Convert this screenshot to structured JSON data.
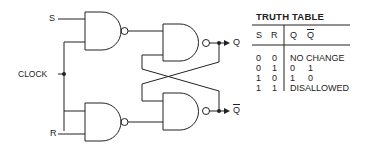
{
  "diagram": {
    "inputs": {
      "s_label": "S",
      "r_label": "R",
      "clock_label": "CLOCK"
    },
    "outputs": {
      "q_label": "Q",
      "qbar_label": "Q"
    },
    "gates": [
      {
        "id": "nand-s",
        "type": "NAND",
        "inputs": [
          "S",
          "CLOCK"
        ]
      },
      {
        "id": "nand-r",
        "type": "NAND",
        "inputs": [
          "CLOCK",
          "R"
        ]
      },
      {
        "id": "nand-q",
        "type": "NAND",
        "inputs": [
          "nand-s",
          "Q-bar feedback"
        ]
      },
      {
        "id": "nand-qbar",
        "type": "NAND",
        "inputs": [
          "Q feedback",
          "nand-r"
        ]
      }
    ],
    "colors": {
      "line": "#222222",
      "background": "#ffffff"
    }
  },
  "truth_table": {
    "title": "TRUTH TABLE",
    "headers": {
      "s": "S",
      "r": "R",
      "q": "Q",
      "qbar": "Q"
    },
    "rows": [
      {
        "s": "0",
        "r": "0",
        "result": "NO CHANGE"
      },
      {
        "s": "0",
        "r": "1",
        "q": "0",
        "qbar": "1"
      },
      {
        "s": "1",
        "r": "0",
        "q": "1",
        "qbar": "0"
      },
      {
        "s": "1",
        "r": "1",
        "result": "DISALLOWED"
      }
    ]
  }
}
